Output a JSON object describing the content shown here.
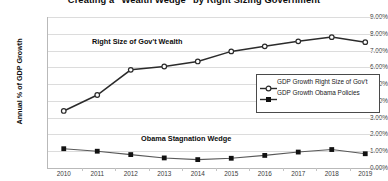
{
  "chart_data": {
    "type": "line",
    "title": "Creating a \"Wealth Wedge\" by Right Sizing Government",
    "xlabel": "",
    "ylabel": "Annual % of GDP Growth",
    "categories": [
      "2010",
      "2011",
      "2012",
      "2013",
      "2014",
      "2015",
      "2016",
      "2017",
      "2018",
      "2019"
    ],
    "ylim": [
      0,
      9
    ],
    "ytick_labels": [
      "9.00%",
      "8.00%",
      "7.00%",
      "6.00%",
      "5.00%",
      "4.00%",
      "3.00%",
      "2.00%",
      "1.00%",
      "0.00%"
    ],
    "ytick_values": [
      9,
      8,
      7,
      6,
      5,
      4,
      3,
      2,
      1,
      0
    ],
    "grid": true,
    "legend_position": "middle-right",
    "series": [
      {
        "name": "GDP Growth Right Size of Gov't",
        "marker": "open-circle",
        "color": "#2b2b2b",
        "values": [
          3.4,
          4.35,
          5.85,
          6.05,
          6.35,
          6.95,
          7.25,
          7.55,
          7.8,
          7.5
        ]
      },
      {
        "name": "GDP Growth Obama Policies",
        "marker": "filled-square",
        "color": "#595959",
        "values": [
          1.15,
          1.0,
          0.8,
          0.6,
          0.5,
          0.58,
          0.75,
          0.95,
          1.1,
          0.85
        ]
      }
    ],
    "annotations": [
      {
        "text": "Right Size of Gov't Wealth",
        "series": "GDP Growth Right Size of Gov't"
      },
      {
        "text": "Obama Stagnation Wedge",
        "series": "GDP Growth Obama Policies"
      }
    ]
  },
  "legend": {
    "items": [
      {
        "label": "GDP Growth Right Size of Gov't",
        "marker": "open-circle"
      },
      {
        "label": "GDP Growth Obama Policies",
        "marker": "filled-square"
      }
    ]
  }
}
